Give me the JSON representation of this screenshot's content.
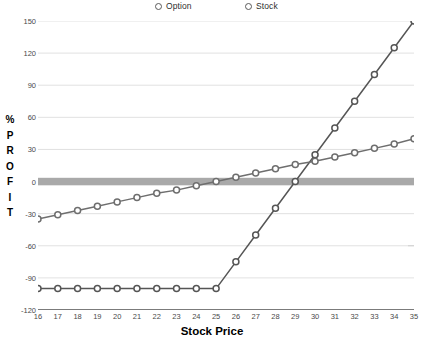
{
  "chart_data": {
    "type": "line",
    "title": "",
    "xlabel": "Stock Price",
    "ylabel": "% PROFIT",
    "xlim": [
      16,
      35
    ],
    "ylim": [
      -120,
      150
    ],
    "grid": true,
    "legend_position": "top",
    "x": [
      16,
      17,
      18,
      19,
      20,
      21,
      22,
      23,
      24,
      25,
      26,
      27,
      28,
      29,
      30,
      31,
      32,
      33,
      34,
      35
    ],
    "xticks": [
      "16",
      "17",
      "18",
      "19",
      "20",
      "21",
      "22",
      "23",
      "24",
      "25",
      "26",
      "27",
      "28",
      "29",
      "30",
      "31",
      "32",
      "33",
      "34",
      "35"
    ],
    "yticks": [
      "150",
      "120",
      "90",
      "60",
      "30",
      "0",
      "-30",
      "-60",
      "-90",
      "-120"
    ],
    "ytick_values": [
      150,
      120,
      90,
      60,
      30,
      0,
      -30,
      -60,
      -90,
      -120
    ],
    "zero_band": {
      "value": 0,
      "color": "#9a9a9a",
      "thickness_units": 7
    },
    "series": [
      {
        "name": "Option",
        "marker": "circle-open",
        "color": "#555555",
        "values": [
          -100,
          -100,
          -100,
          -100,
          -100,
          -100,
          -100,
          -100,
          -100,
          -100,
          -75,
          -50,
          -25,
          0,
          25,
          50,
          75,
          100,
          125,
          150
        ]
      },
      {
        "name": "Stock",
        "marker": "circle-open",
        "color": "#6e6e6e",
        "values": [
          -35,
          -31,
          -27,
          -23,
          -19,
          -15,
          -11,
          -8,
          -4,
          0,
          4,
          8,
          12,
          16,
          19,
          23,
          27,
          31,
          35,
          40
        ]
      }
    ]
  },
  "legend": {
    "items": [
      {
        "label": "Option"
      },
      {
        "label": "Stock"
      }
    ]
  },
  "axes": {
    "y_title_chars": [
      "%",
      "P",
      "R",
      "O",
      "F",
      "I",
      "T"
    ],
    "x_title": "Stock Price"
  },
  "colors": {
    "grid": "#d9d9d9",
    "axis": "#555555",
    "option_line": "#555555",
    "stock_line": "#6e6e6e",
    "zero_band": "#9a9a9a",
    "text": "#3a3a3a"
  }
}
